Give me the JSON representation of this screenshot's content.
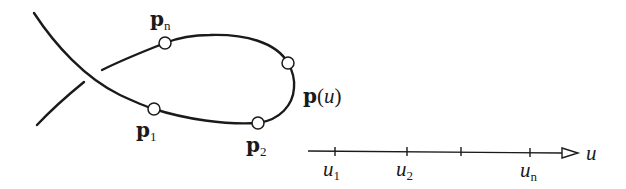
{
  "diagram": {
    "curve_label": {
      "bold": "p",
      "open": "(",
      "var": "u",
      "close": ")"
    },
    "points": [
      {
        "id": "p1",
        "base": "p",
        "sub": "1"
      },
      {
        "id": "p2",
        "base": "p",
        "sub": "2"
      },
      {
        "id": "pn",
        "base": "p",
        "sub": "n"
      }
    ],
    "axis": {
      "label": "u",
      "ticks": [
        {
          "base": "u",
          "sub": "1"
        },
        {
          "base": "u",
          "sub": "2"
        },
        {
          "base": "",
          "sub": ""
        },
        {
          "base": "u",
          "sub": "n"
        }
      ]
    },
    "colors": {
      "stroke": "#1a1a1a",
      "background": "#ffffff",
      "node_fill": "#ffffff"
    }
  }
}
